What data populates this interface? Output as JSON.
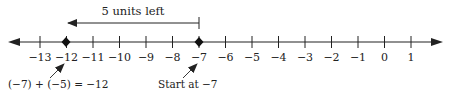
{
  "diagram": {
    "type": "number-line",
    "title_arrow_label": "5 units left",
    "ticks": [
      "−13",
      "−12",
      "−11",
      "−10",
      "−9",
      "−8",
      "−7",
      "−6",
      "−5",
      "−4",
      "−3",
      "−2",
      "−1",
      "0",
      "1"
    ],
    "start_point": {
      "value": -7,
      "label": "Start at −7"
    },
    "end_point": {
      "value": -12,
      "label": "(−7) + (−5) = −12"
    },
    "move": {
      "direction": "left",
      "units": 5
    },
    "colors": {
      "line": "#222222",
      "background": "#ffffff"
    }
  }
}
